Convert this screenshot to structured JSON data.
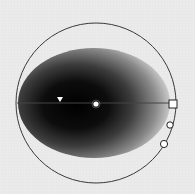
{
  "control": {
    "type": "lighting-effects-preview",
    "light_type": "spotlight"
  },
  "colors": {
    "background": "#e8e8e8",
    "light_center": "#000000",
    "light_edge": "#d8d8d8",
    "outline": "#333333",
    "handle_fill": "#ffffff"
  },
  "geometry": {
    "outer_circle": {
      "cx": 96,
      "cy": 103,
      "r": 80
    },
    "ellipse": {
      "cx": 94,
      "cy": 103,
      "rx": 76,
      "ry": 55
    },
    "axis_line": {
      "x1": 17,
      "y1": 103,
      "x2": 173,
      "y2": 103
    },
    "center_handle": {
      "x": 96,
      "y": 104
    },
    "focus_marker": {
      "x": 60,
      "y": 99
    },
    "square_handle": {
      "x": 173,
      "y": 104
    },
    "circle_handle_1": {
      "x": 170,
      "y": 125
    },
    "circle_handle_2": {
      "x": 164,
      "y": 144
    }
  }
}
